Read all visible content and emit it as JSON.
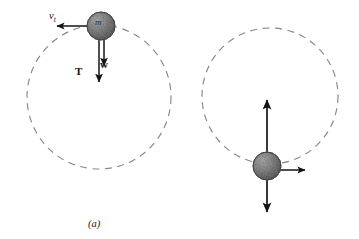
{
  "figure": {
    "width": 359,
    "height": 239,
    "background": "#ffffff"
  },
  "colors": {
    "orbit_dashed": "#8d8397",
    "vector_stroke": "#141414",
    "ball_fill": "#8a8a8a",
    "ball_edge": "#4a4a4a",
    "text": "#141414"
  },
  "panels": [
    {
      "id": "a",
      "caption": "(a)",
      "position": "top",
      "circle": {
        "cx": 99,
        "cy": 97,
        "r": 72,
        "dashed": true
      },
      "ball": {
        "cx": 101,
        "cy": 26,
        "r": 14,
        "label": "m"
      },
      "vectors": [
        {
          "name": "velocity",
          "label": "v",
          "subscript": "t",
          "direction": "left",
          "from": [
            101,
            26
          ],
          "to": [
            55,
            26
          ]
        },
        {
          "name": "tension",
          "label": "T",
          "direction": "down",
          "from": [
            99,
            26
          ],
          "to": [
            99,
            84
          ]
        },
        {
          "name": "weight",
          "label": "w",
          "direction": "down",
          "from": [
            104,
            26
          ],
          "to": [
            104,
            68
          ]
        }
      ]
    },
    {
      "id": "b",
      "caption": "(b)",
      "position": "bottom",
      "circle": {
        "cx": 270,
        "cy": 96,
        "r": 68,
        "dashed": true
      },
      "ball": {
        "cx": 267,
        "cy": 166,
        "r": 14,
        "label": "m"
      },
      "vectors": [
        {
          "name": "tension",
          "label": "T",
          "direction": "up",
          "from": [
            267,
            166
          ],
          "to": [
            267,
            98
          ]
        },
        {
          "name": "weight",
          "label": "w",
          "direction": "down",
          "from": [
            267,
            166
          ],
          "to": [
            267,
            214
          ]
        },
        {
          "name": "velocity",
          "label": "v",
          "subscript": "b",
          "direction": "right",
          "from": [
            267,
            170
          ],
          "to": [
            307,
            170
          ]
        }
      ]
    }
  ],
  "labels": {
    "tension": "T",
    "weight": "w",
    "mass": "m",
    "velocity_top": "v",
    "velocity_top_sub": "t",
    "velocity_bottom": "v",
    "velocity_bottom_sub": "b",
    "caption_a": "(a)",
    "caption_b": "(b)"
  }
}
